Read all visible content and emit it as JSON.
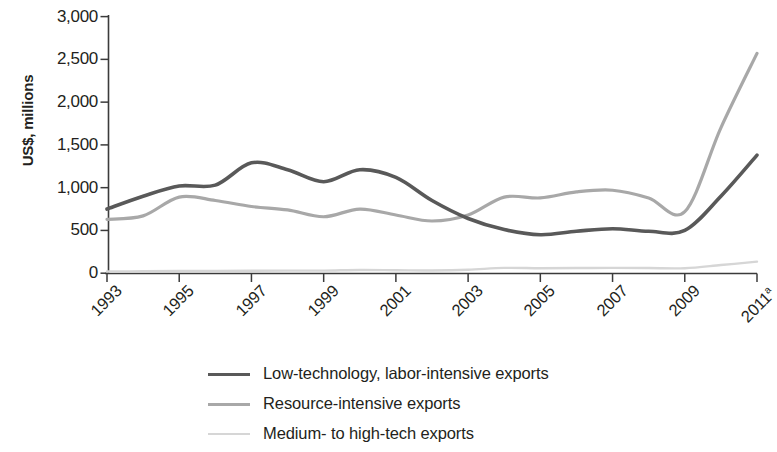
{
  "axes": {
    "y_title": "US$, millions",
    "y_ticks": [
      "3,000",
      "2,500",
      "2,000",
      "1,500",
      "1,000",
      "500",
      "0"
    ],
    "x_ticks": [
      {
        "label": "1993",
        "sup": ""
      },
      {
        "label": "1995",
        "sup": ""
      },
      {
        "label": "1997",
        "sup": ""
      },
      {
        "label": "1999",
        "sup": ""
      },
      {
        "label": "2001",
        "sup": ""
      },
      {
        "label": "2003",
        "sup": ""
      },
      {
        "label": "2005",
        "sup": ""
      },
      {
        "label": "2007",
        "sup": ""
      },
      {
        "label": "2009",
        "sup": ""
      },
      {
        "label": "2011",
        "sup": "a"
      }
    ]
  },
  "legend": {
    "items": [
      {
        "label": "Low-technology, labor-intensive exports",
        "color": "#595959",
        "width": 3.6
      },
      {
        "label": "Resource-intensive exports",
        "color": "#a8a8a8",
        "width": 3.2
      },
      {
        "label": "Medium- to high-tech exports",
        "color": "#d6d6d6",
        "width": 2.6
      }
    ]
  },
  "chart_data": {
    "type": "line",
    "title": "",
    "subtitle": "",
    "xlabel": "",
    "ylabel": "US$, millions",
    "xlim": [
      1993,
      2011
    ],
    "ylim": [
      0,
      3000
    ],
    "ytick_values": [
      0,
      500,
      1000,
      1500,
      2000,
      2500,
      3000
    ],
    "xtick_values": [
      1993,
      1995,
      1997,
      1999,
      2001,
      2003,
      2005,
      2007,
      2009,
      2011
    ],
    "grid": false,
    "legend_position": "bottom-center",
    "annotations": [
      "2011 figures marked with superscript a"
    ],
    "x": [
      1993,
      1994,
      1995,
      1996,
      1997,
      1998,
      1999,
      2000,
      2001,
      2002,
      2003,
      2004,
      2005,
      2006,
      2007,
      2008,
      2009,
      2010,
      2011
    ],
    "series": [
      {
        "name": "Low-technology, labor-intensive exports",
        "color": "#595959",
        "values": [
          750,
          900,
          1020,
          1030,
          1290,
          1210,
          1070,
          1210,
          1120,
          850,
          640,
          510,
          450,
          490,
          520,
          490,
          500,
          900,
          1380
        ]
      },
      {
        "name": "Resource-intensive exports",
        "color": "#a8a8a8",
        "values": [
          630,
          670,
          890,
          850,
          780,
          740,
          660,
          750,
          680,
          610,
          680,
          890,
          880,
          950,
          970,
          880,
          720,
          1700,
          2570
        ]
      },
      {
        "name": "Medium- to high-tech exports",
        "color": "#d6d6d6",
        "values": [
          20,
          22,
          25,
          25,
          28,
          30,
          30,
          38,
          35,
          32,
          40,
          62,
          58,
          60,
          62,
          60,
          58,
          95,
          135
        ]
      }
    ]
  }
}
